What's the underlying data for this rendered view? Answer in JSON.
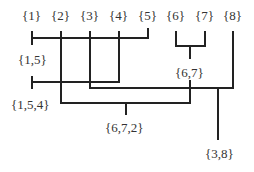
{
  "diagram": {
    "type": "dendrogram-merge-tree",
    "leaves": [
      "{1}",
      "{2}",
      "{3}",
      "{4}",
      "{5}",
      "{6}",
      "{7}",
      "{8}"
    ],
    "merges": [
      {
        "label": "{1,5}"
      },
      {
        "label": "{6,7}"
      },
      {
        "label": "{1,5,4}"
      },
      {
        "label": "{6,7,2}"
      },
      {
        "label": "{3,8}"
      }
    ],
    "line_color": "#222222",
    "text_color": "#333333"
  }
}
